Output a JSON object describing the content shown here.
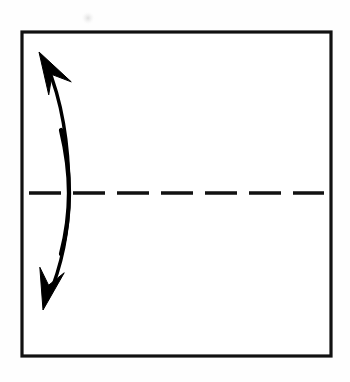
{
  "figure": {
    "kind": "origami-fold-diagram",
    "title": "Valley fold in half along horizontal crease",
    "canvas": {
      "width": 350,
      "height": 382,
      "background_color": "#fefefe"
    },
    "ink_color": "#000000",
    "elements": {
      "paper_square": {
        "label": "paper square outline",
        "x": 22,
        "y": 32,
        "width": 309,
        "height": 324,
        "stroke_width": 3.2,
        "fill_color": "#ffffff",
        "stroke_color": "#111111"
      },
      "fold_line": {
        "label": "horizontal dashed fold crease",
        "fold_type": "valley",
        "line_style": "dashed",
        "y": 193,
        "x_start": 29,
        "x_end": 324,
        "stroke_width": 3.4,
        "stroke_color": "#111111",
        "dash_length": 32,
        "dash_gap": 12,
        "dash_count": 7
      },
      "fold_arrow": {
        "label": "double headed curved fold arrow",
        "heads": 2,
        "direction": "bidirectional",
        "arc_bulge": "right",
        "stroke_color": "#000000",
        "top_tip_x": 39,
        "top_tip_y": 52,
        "bottom_tip_x": 43,
        "bottom_tip_y": 310,
        "arc_widest_x": 69,
        "arc_widest_y": 193
      },
      "scan_artifact": {
        "label": "faint scan smudge",
        "x": 88,
        "y": 18,
        "radius": 7,
        "opacity": 0.06
      }
    }
  }
}
